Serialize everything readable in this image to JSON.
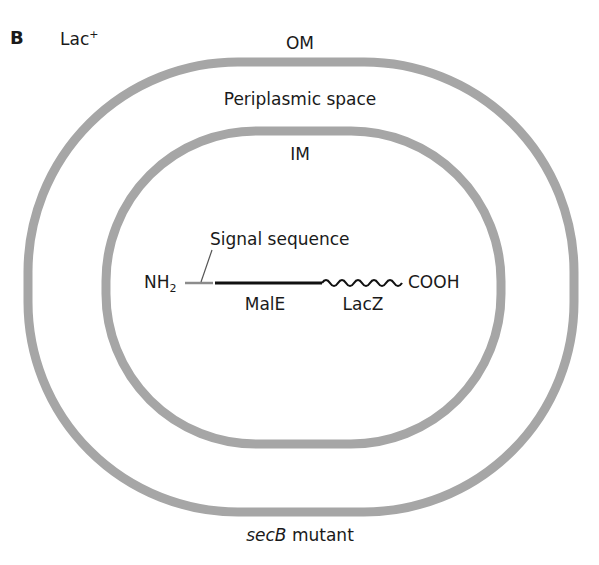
{
  "panel": {
    "letter": "B",
    "phenotype_base": "Lac",
    "phenotype_sup": "+"
  },
  "membranes": {
    "outer_label": "OM",
    "periplasm_label": "Periplasmic space",
    "inner_label": "IM",
    "ring_color": "#a6a6a6"
  },
  "protein": {
    "n_terminus_base": "NH",
    "n_terminus_sub": "2",
    "c_terminus": "COOH",
    "signal_label": "Signal sequence",
    "male_label": "MalE",
    "lacz_label": "LacZ",
    "signal_color": "#8c8c8c",
    "male_color": "#111111"
  },
  "caption": {
    "gene_italic": "secB",
    "rest": " mutant"
  }
}
